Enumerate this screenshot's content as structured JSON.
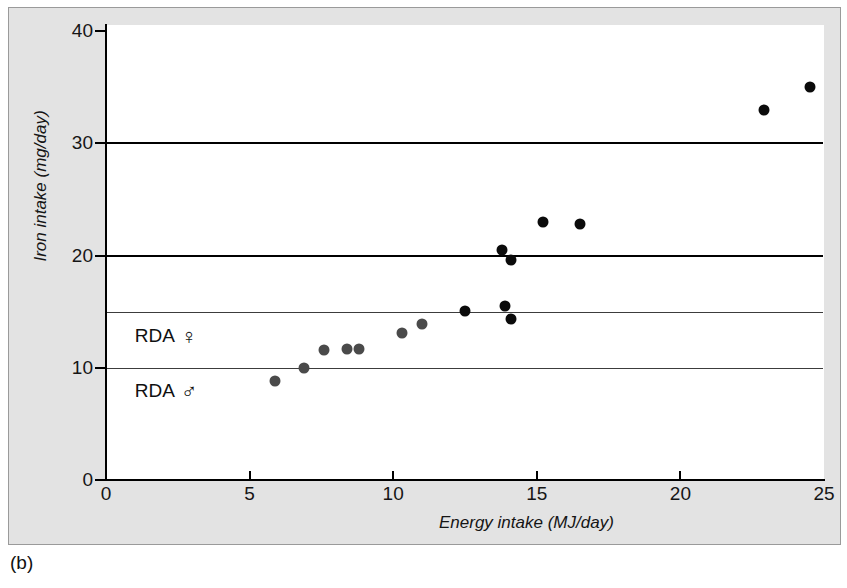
{
  "caption": "(b)",
  "chart_data": {
    "type": "scatter",
    "title": "",
    "xlabel": "Energy intake (MJ/day)",
    "ylabel": "Iron intake (mg/day)",
    "xlim": [
      0,
      25
    ],
    "ylim": [
      0,
      40
    ],
    "xticks": [
      0,
      5,
      10,
      15,
      20,
      25
    ],
    "yticks": [
      0,
      10,
      20,
      30,
      40
    ],
    "xtick_labels": [
      "0",
      "5",
      "10",
      "15",
      "20",
      "25"
    ],
    "ytick_labels": [
      "0",
      "10",
      "20",
      "30",
      "40"
    ],
    "grid": "horizontal reference lines at y = 10, 15, 20, 30",
    "legend": "none",
    "reference_lines": [
      {
        "name": "gridline-30",
        "y": 30,
        "style": "major",
        "label": ""
      },
      {
        "name": "gridline-20",
        "y": 20,
        "style": "major",
        "label": ""
      },
      {
        "name": "rda-female-line",
        "y": 15,
        "style": "minor",
        "label": "RDA",
        "symbol": "♀"
      },
      {
        "name": "rda-male-line",
        "y": 10,
        "style": "minor",
        "label": "RDA",
        "symbol": "♂"
      }
    ],
    "annotations": [
      {
        "name": "rda-female-annotation",
        "text": "RDA",
        "symbol": "♀",
        "x": 1.0,
        "y": 13.7
      },
      {
        "name": "rda-male-annotation",
        "text": "RDA",
        "symbol": "♂",
        "x": 1.0,
        "y": 8.8
      }
    ],
    "series": [
      {
        "name": "Subjects (lower intake)",
        "color": "#4a4a4a",
        "marker": "filled-circle",
        "marker_size": 11,
        "points": [
          {
            "x": 5.9,
            "y": 8.8
          },
          {
            "x": 6.9,
            "y": 10.0
          },
          {
            "x": 7.6,
            "y": 11.6
          },
          {
            "x": 8.4,
            "y": 11.7
          },
          {
            "x": 8.8,
            "y": 11.7
          },
          {
            "x": 10.3,
            "y": 13.1
          },
          {
            "x": 11.0,
            "y": 13.9
          }
        ]
      },
      {
        "name": "Subjects (higher intake)",
        "color": "#0b0b0b",
        "marker": "filled-circle",
        "marker_size": 11,
        "points": [
          {
            "x": 12.5,
            "y": 15.1
          },
          {
            "x": 13.9,
            "y": 15.5
          },
          {
            "x": 14.1,
            "y": 14.3
          },
          {
            "x": 13.8,
            "y": 20.5
          },
          {
            "x": 14.1,
            "y": 19.6
          },
          {
            "x": 15.2,
            "y": 23.0
          },
          {
            "x": 16.5,
            "y": 22.8
          },
          {
            "x": 22.9,
            "y": 33.0
          },
          {
            "x": 24.5,
            "y": 35.0
          }
        ]
      }
    ]
  }
}
